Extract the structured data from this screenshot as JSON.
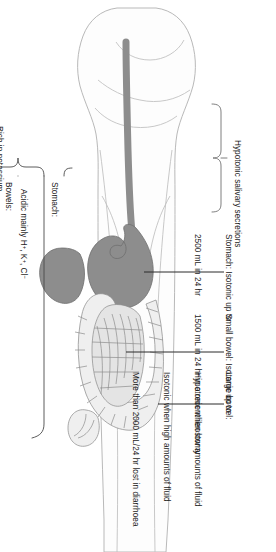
{
  "figure": {
    "orientation": "rotated-90"
  },
  "callouts": {
    "saliva": "Hypotonic salivary secretions",
    "stomach_volume_l1": "Stomach: Isotonic up to",
    "stomach_volume_l2": "2500 mL in 24 hr",
    "small_bowel_l1": "Small bowel: Isotonic up to",
    "small_bowel_l2": "1500 mL in 24 hr in a recent ileostomy",
    "large_bowel_l1": "Large bowel:",
    "large_bowel_l2": "Hypotonic when low amounts of fluid",
    "large_bowel_l3": "Isotonic when high amounts of fluid",
    "large_bowel_l4": "More than 2000 mL/24 hr lost in diarrhoea"
  },
  "composition": {
    "potassium_note": "Rich in potassium",
    "stomach": {
      "heading": "Stomach:",
      "lines": [
        "Acidic mainly H+, K+, Cl−",
        "Low Na+ 50 mmol/L",
        "Low HCO3−"
      ]
    },
    "bowels": {
      "heading": "Bowels:",
      "lines": [
        "Alkaline",
        "High Na+ 130–140 mmol/L",
        "Lower Cl− 60–95 mmol/L",
        "High HCO3−"
      ]
    }
  },
  "anatomy": {
    "parts": [
      "body-outline",
      "oesophagus",
      "stomach",
      "liver",
      "small-bowel",
      "large-bowel"
    ]
  },
  "colors": {
    "ink": "#1c1c1c",
    "outline": "#b9b9b9",
    "organ_dark": "#8d8d8d",
    "organ_light": "#efefef",
    "leader": "#2b2b2b"
  }
}
